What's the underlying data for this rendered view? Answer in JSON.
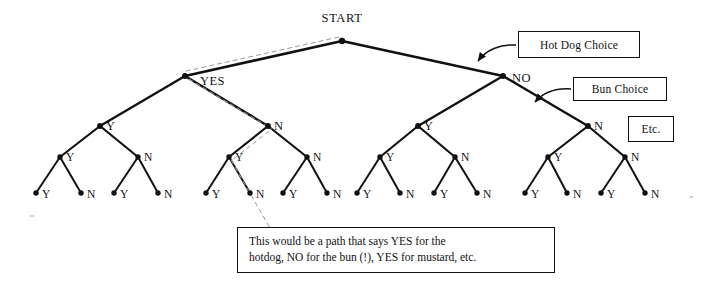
{
  "diagram": {
    "root": {
      "label": "START",
      "x": 342,
      "y": 41
    },
    "colors": {
      "line": "#111111",
      "dashed_path": "#9a9a9a",
      "background": "#ffffff",
      "text": "#111111"
    },
    "level1": [
      {
        "label": "YES",
        "x": 185,
        "y": 76,
        "label_x": 200,
        "label_y": 85
      },
      {
        "label": "NO",
        "x": 503,
        "y": 76,
        "label_x": 512,
        "label_y": 82
      }
    ],
    "level2": [
      {
        "label": "Y",
        "x": 100,
        "y": 126,
        "label_x": 106,
        "label_y": 130
      },
      {
        "label": "N",
        "x": 268,
        "y": 126,
        "label_x": 274,
        "label_y": 130
      },
      {
        "label": "Y",
        "x": 418,
        "y": 126,
        "label_x": 424,
        "label_y": 130
      },
      {
        "label": "N",
        "x": 588,
        "y": 126,
        "label_x": 594,
        "label_y": 130
      }
    ],
    "level3": [
      {
        "label": "Y",
        "x": 60,
        "y": 157,
        "label_x": 66,
        "label_y": 161
      },
      {
        "label": "N",
        "x": 138,
        "y": 157,
        "label_x": 144,
        "label_y": 161
      },
      {
        "label": "Y",
        "x": 229,
        "y": 157,
        "label_x": 235,
        "label_y": 161
      },
      {
        "label": "N",
        "x": 307,
        "y": 157,
        "label_x": 313,
        "label_y": 161
      },
      {
        "label": "Y",
        "x": 380,
        "y": 157,
        "label_x": 386,
        "label_y": 161
      },
      {
        "label": "N",
        "x": 455,
        "y": 157,
        "label_x": 461,
        "label_y": 161
      },
      {
        "label": "Y",
        "x": 548,
        "y": 157,
        "label_x": 554,
        "label_y": 161
      },
      {
        "label": "N",
        "x": 625,
        "y": 157,
        "label_x": 631,
        "label_y": 161
      }
    ],
    "leaves": [
      {
        "label": "Y",
        "x": 36,
        "y": 193,
        "label_x": 42,
        "label_y": 198
      },
      {
        "label": "N",
        "x": 81,
        "y": 193,
        "label_x": 87,
        "label_y": 198
      },
      {
        "label": "Y",
        "x": 114,
        "y": 193,
        "label_x": 120,
        "label_y": 198
      },
      {
        "label": "N",
        "x": 158,
        "y": 193,
        "label_x": 164,
        "label_y": 198
      },
      {
        "label": "Y",
        "x": 206,
        "y": 193,
        "label_x": 212,
        "label_y": 198
      },
      {
        "label": "N",
        "x": 250,
        "y": 193,
        "label_x": 256,
        "label_y": 198
      },
      {
        "label": "Y",
        "x": 283,
        "y": 193,
        "label_x": 289,
        "label_y": 198
      },
      {
        "label": "N",
        "x": 327,
        "y": 193,
        "label_x": 333,
        "label_y": 198
      },
      {
        "label": "Y",
        "x": 357,
        "y": 193,
        "label_x": 363,
        "label_y": 198
      },
      {
        "label": "N",
        "x": 400,
        "y": 193,
        "label_x": 406,
        "label_y": 198
      },
      {
        "label": "Y",
        "x": 434,
        "y": 193,
        "label_x": 440,
        "label_y": 198
      },
      {
        "label": "N",
        "x": 477,
        "y": 193,
        "label_x": 483,
        "label_y": 198
      },
      {
        "label": "Y",
        "x": 525,
        "y": 193,
        "label_x": 531,
        "label_y": 198
      },
      {
        "label": "N",
        "x": 567,
        "y": 193,
        "label_x": 573,
        "label_y": 198
      },
      {
        "label": "Y",
        "x": 601,
        "y": 193,
        "label_x": 607,
        "label_y": 198
      },
      {
        "label": "N",
        "x": 645,
        "y": 193,
        "label_x": 651,
        "label_y": 198
      }
    ],
    "highlighted_path": {
      "description": "dashed trace of one example path",
      "points": "182,72 339,38"
    }
  },
  "callouts": {
    "hot_dog": "Hot Dog Choice",
    "bun": "Bun Choice",
    "etc": "Etc."
  },
  "annotation": {
    "line1": "This would be a path that says YES for the",
    "line2": "hotdog, NO for the bun (!), YES for mustard, etc."
  }
}
